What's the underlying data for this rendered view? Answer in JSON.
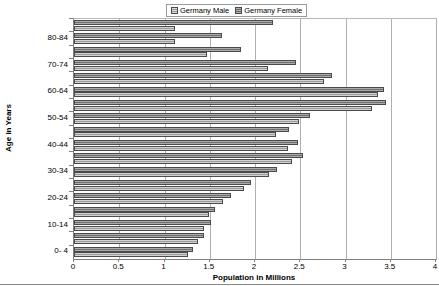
{
  "chart_data": {
    "type": "bar",
    "orientation": "horizontal",
    "title": "",
    "xlabel": "Population in Millions",
    "ylabel": "Age in Years",
    "xlim": [
      0,
      4
    ],
    "xticks": [
      "0",
      "0.5",
      "1",
      "1.5",
      "2",
      "2.5",
      "3",
      "3.5",
      "4"
    ],
    "xtick_values": [
      0,
      0.5,
      1,
      1.5,
      2,
      2.5,
      3,
      3.5,
      4
    ],
    "grid": true,
    "grid_axis": "x",
    "legend_position": "top-center",
    "categories": [
      "85+",
      "80-84",
      "75-79",
      "70-74",
      "65-69",
      "60-64",
      "55-59",
      "50-54",
      "45-49",
      "40-44",
      "35-39",
      "30-34",
      "25-29",
      "20-24",
      "15-19",
      "10-14",
      "5- 9",
      "0- 4"
    ],
    "category_labels_shown": [
      "",
      "80-84",
      "",
      "70-74",
      "",
      "60-64",
      "",
      "50-54",
      "",
      "40-44",
      "",
      "30-34",
      "",
      "20-24",
      "",
      "10-14",
      "",
      "0- 4"
    ],
    "series": [
      {
        "name": "Germany Male",
        "color": "#9c9c9c",
        "values": [
          1.12,
          1.12,
          1.47,
          2.14,
          2.76,
          3.36,
          3.29,
          2.49,
          2.23,
          2.36,
          2.41,
          2.15,
          1.88,
          1.65,
          1.49,
          1.44,
          1.37,
          1.26
        ]
      },
      {
        "name": "Germany Female",
        "color": "#787878",
        "values": [
          2.2,
          1.63,
          1.84,
          2.45,
          2.85,
          3.43,
          3.45,
          2.61,
          2.38,
          2.48,
          2.53,
          2.24,
          1.96,
          1.73,
          1.56,
          1.51,
          1.44,
          1.32
        ]
      }
    ]
  },
  "legend": {
    "entries": [
      {
        "label": "Germany Male",
        "icon": "legend-swatch-male"
      },
      {
        "label": "Germany Female",
        "icon": "legend-swatch-female"
      }
    ]
  },
  "axes": {
    "x_title": "Population in Millions",
    "y_title": "Age in Years"
  }
}
